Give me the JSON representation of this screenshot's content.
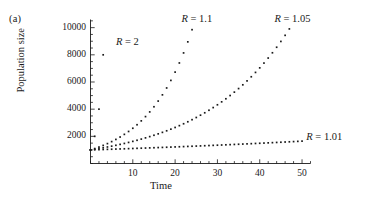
{
  "figure": {
    "panel_label": "(a)",
    "background_color": "#ffffff",
    "ink_color": "#1a1a1a"
  },
  "chart_data": {
    "type": "scatter",
    "title": "",
    "subtitle": "",
    "xlabel": "Time",
    "ylabel": "Population size",
    "xlim": [
      0,
      52
    ],
    "ylim": [
      0,
      10600
    ],
    "grid": false,
    "legend_position": "inline-annotations",
    "marker": "small-square-dot",
    "x_ticks": [
      10,
      20,
      30,
      40,
      50
    ],
    "x_tick_labels": [
      "10",
      "20",
      "30",
      "40",
      "50"
    ],
    "x_minor_tick_step": 2,
    "y_ticks": [
      2000,
      4000,
      6000,
      8000,
      10000
    ],
    "y_tick_labels": [
      "2000",
      "4000",
      "6000",
      "8000",
      "10000"
    ],
    "y_minor_tick_step": 500,
    "initial_population": 1000,
    "model": "N(t) = 1000 * R^t",
    "series": [
      {
        "name": "R = 2",
        "label_text": "R = 2",
        "label_r": "R",
        "label_eq": "= 2",
        "R": 2,
        "label_x": 6.0,
        "label_y": 8900,
        "x": [
          0,
          1,
          2,
          3
        ],
        "values": [
          1000,
          2000,
          4000,
          8000
        ]
      },
      {
        "name": "R = 1.1",
        "label_text": "R = 1.1",
        "label_r": "R",
        "label_eq": "= 1.1",
        "R": 1.1,
        "label_x": 21.5,
        "label_y": 10550,
        "x": [
          0,
          1,
          2,
          3,
          4,
          5,
          6,
          7,
          8,
          9,
          10,
          11,
          12,
          13,
          14,
          15,
          16,
          17,
          18,
          19,
          20,
          21,
          22,
          23,
          24
        ],
        "values": [
          1000,
          1100,
          1210,
          1331,
          1464,
          1611,
          1772,
          1949,
          2144,
          2358,
          2594,
          2853,
          3138,
          3452,
          3797,
          4177,
          4595,
          5054,
          5560,
          6116,
          6727,
          7400,
          8140,
          8954,
          9850
        ]
      },
      {
        "name": "R = 1.05",
        "label_text": "R = 1.05",
        "label_r": "R",
        "label_eq": "= 1.05",
        "R": 1.05,
        "label_x": 43.5,
        "label_y": 10550,
        "x": [
          0,
          1,
          2,
          3,
          4,
          5,
          6,
          7,
          8,
          9,
          10,
          11,
          12,
          13,
          14,
          15,
          16,
          17,
          18,
          19,
          20,
          21,
          22,
          23,
          24,
          25,
          26,
          27,
          28,
          29,
          30,
          31,
          32,
          33,
          34,
          35,
          36,
          37,
          38,
          39,
          40,
          41,
          42,
          43,
          44,
          45,
          46,
          47
        ],
        "values": [
          1000,
          1050,
          1103,
          1158,
          1216,
          1276,
          1340,
          1407,
          1477,
          1551,
          1629,
          1710,
          1796,
          1886,
          1980,
          2079,
          2183,
          2292,
          2407,
          2527,
          2653,
          2786,
          2925,
          3072,
          3225,
          3386,
          3556,
          3733,
          3920,
          4116,
          4322,
          4538,
          4765,
          5003,
          5253,
          5516,
          5792,
          6081,
          6385,
          6705,
          7040,
          7392,
          7762,
          8150,
          8557,
          8985,
          9434,
          9906
        ]
      },
      {
        "name": "R = 1.01",
        "label_text": "R = 1.01",
        "label_r": "R",
        "label_eq": "= 1.01",
        "R": 1.01,
        "label_x": 51.0,
        "label_y": 1900,
        "x": [
          0,
          1,
          2,
          3,
          4,
          5,
          6,
          7,
          8,
          9,
          10,
          11,
          12,
          13,
          14,
          15,
          16,
          17,
          18,
          19,
          20,
          21,
          22,
          23,
          24,
          25,
          26,
          27,
          28,
          29,
          30,
          31,
          32,
          33,
          34,
          35,
          36,
          37,
          38,
          39,
          40,
          41,
          42,
          43,
          44,
          45,
          46,
          47,
          48,
          49,
          50
        ],
        "values": [
          1000,
          1010,
          1020,
          1030,
          1041,
          1051,
          1062,
          1072,
          1083,
          1094,
          1105,
          1116,
          1127,
          1138,
          1149,
          1161,
          1173,
          1184,
          1196,
          1208,
          1220,
          1232,
          1245,
          1257,
          1270,
          1282,
          1295,
          1308,
          1321,
          1335,
          1348,
          1361,
          1375,
          1389,
          1403,
          1417,
          1431,
          1445,
          1460,
          1475,
          1489,
          1504,
          1520,
          1535,
          1550,
          1566,
          1582,
          1597,
          1613,
          1630,
          1647
        ]
      }
    ]
  }
}
